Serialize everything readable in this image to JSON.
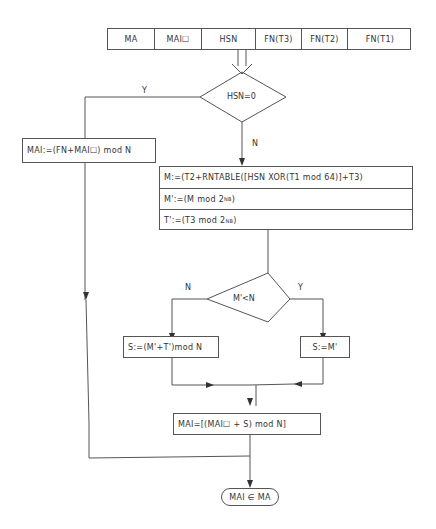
{
  "register": {
    "fields": [
      "MA",
      "MAI0",
      "HSN",
      "FN(T3)",
      "FN(T2)",
      "FN(T1)"
    ],
    "display": [
      "MA",
      "MAI☐",
      "HSN",
      "FN(T3)",
      "FN(T2)",
      "FN(T1)"
    ]
  },
  "decision_hsn": {
    "condition": "HSN=0",
    "yes_label": "Y",
    "no_label": "N"
  },
  "yes_branch": {
    "text": "MAI:=(FN+MAI☐) mod N"
  },
  "no_branch": {
    "m_expr": "M:=(T2+RNTABLE([HSN XOR(T1 mod 64)]+T3)",
    "m_prime_prefix": "M':=(M mod 2",
    "m_prime_sup": "NB",
    "m_prime_suffix": ")",
    "t_prime_prefix": "T':=(T3 mod 2",
    "t_prime_sup": "NB",
    "t_prime_suffix": " )"
  },
  "decision_m": {
    "condition": "M'<N",
    "yes_label": "Y",
    "no_label": "N"
  },
  "s_no": {
    "text": "S:=(M'+T')mod N"
  },
  "s_yes": {
    "text": "S:=M'"
  },
  "mai_final": {
    "text": "MAI=[(MAI☐ + S) mod N]"
  },
  "terminal": {
    "text": "MAI ∈ MA"
  },
  "colors": {
    "line": "#555555",
    "text": "#333333",
    "background": "#ffffff"
  }
}
